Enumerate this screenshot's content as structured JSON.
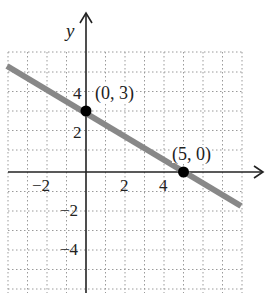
{
  "graph": {
    "axis_label_y": "y",
    "tick_labels_x": [
      "−2",
      "2",
      "4"
    ],
    "tick_labels_y": [
      "4",
      "2",
      "−2",
      "−4"
    ],
    "points": [
      {
        "label": "(0, 3)",
        "x": 0,
        "y": 3
      },
      {
        "label": "(5, 0)",
        "x": 5,
        "y": 0
      }
    ],
    "line": {
      "equation": "y = -3/5 x + 3",
      "color": "#888888"
    },
    "point_color": "#000000",
    "grid": {
      "xmin": -4,
      "xmax": 8,
      "ymin": -6,
      "ymax": 6
    }
  }
}
